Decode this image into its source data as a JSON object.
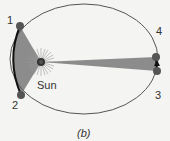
{
  "diagram": {
    "caption": "(b)",
    "sun_label": "Sun",
    "points": [
      {
        "id": "1",
        "label": "1"
      },
      {
        "id": "2",
        "label": "2"
      },
      {
        "id": "3",
        "label": "3"
      },
      {
        "id": "4",
        "label": "4"
      }
    ],
    "colors": {
      "orbit": "#555555",
      "swept_area": "#8a8a8a",
      "planet": "#555555",
      "sun": "#333333",
      "background": "#f4f4f2"
    }
  }
}
